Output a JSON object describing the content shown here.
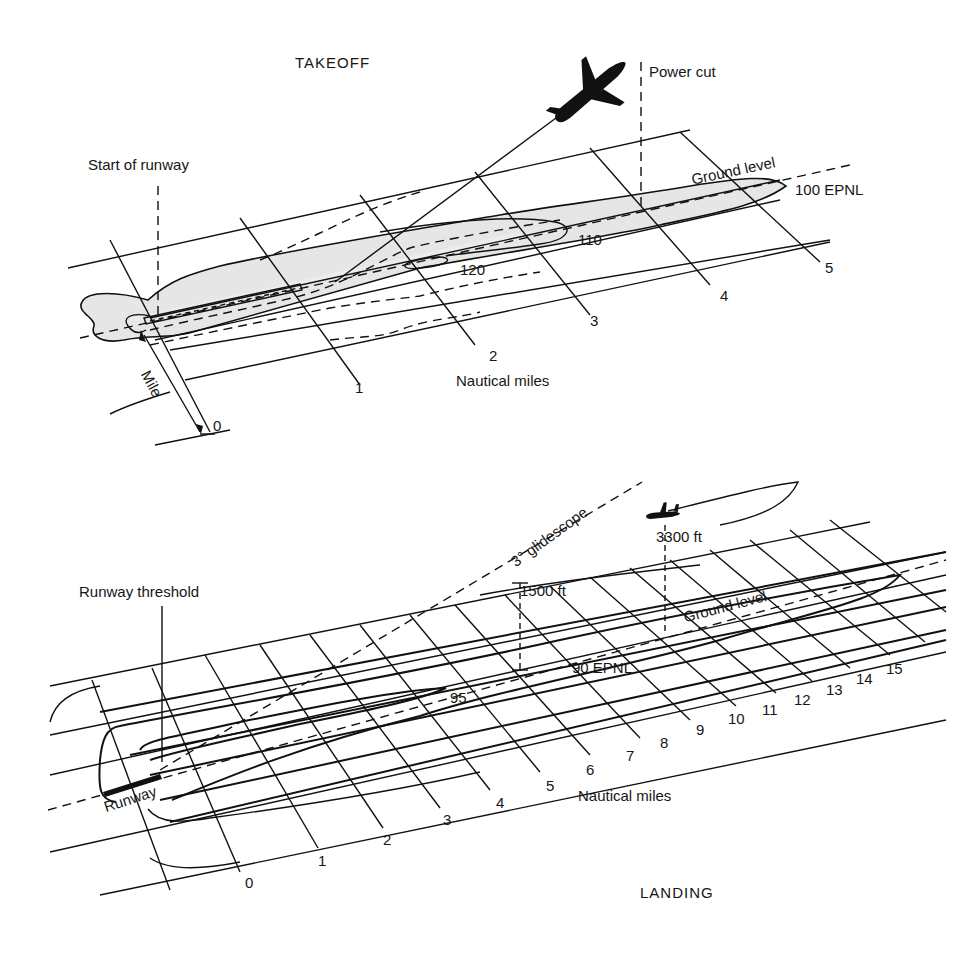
{
  "takeoff": {
    "title": "TAKEOFF",
    "labels": {
      "start_of_runway": "Start of runway",
      "power_cut": "Power cut",
      "ground_level": "Ground level",
      "mile": "Mile",
      "nautical_miles": "Nautical miles"
    },
    "contours": [
      "120",
      "110",
      "100 EPNL"
    ],
    "axis_ticks": [
      "0",
      "1",
      "2",
      "3",
      "4",
      "5"
    ]
  },
  "landing": {
    "title": "LANDING",
    "labels": {
      "runway_threshold": "Runway threshold",
      "runway": "Runway",
      "glidescope": "3° glidescope",
      "altitude_1500": "1500 ft",
      "altitude_3300": "3300 ft",
      "ground_level": "Ground level",
      "nautical_miles": "Nautical miles"
    },
    "contours": [
      "95",
      "90 EPNL"
    ],
    "axis_ticks": [
      "0",
      "1",
      "2",
      "3",
      "4",
      "5",
      "6",
      "7",
      "8",
      "9",
      "10",
      "11",
      "12",
      "13",
      "14",
      "15"
    ]
  },
  "icons": {
    "takeoff_aircraft": "airplane-climbing",
    "landing_aircraft": "airplane-level"
  }
}
